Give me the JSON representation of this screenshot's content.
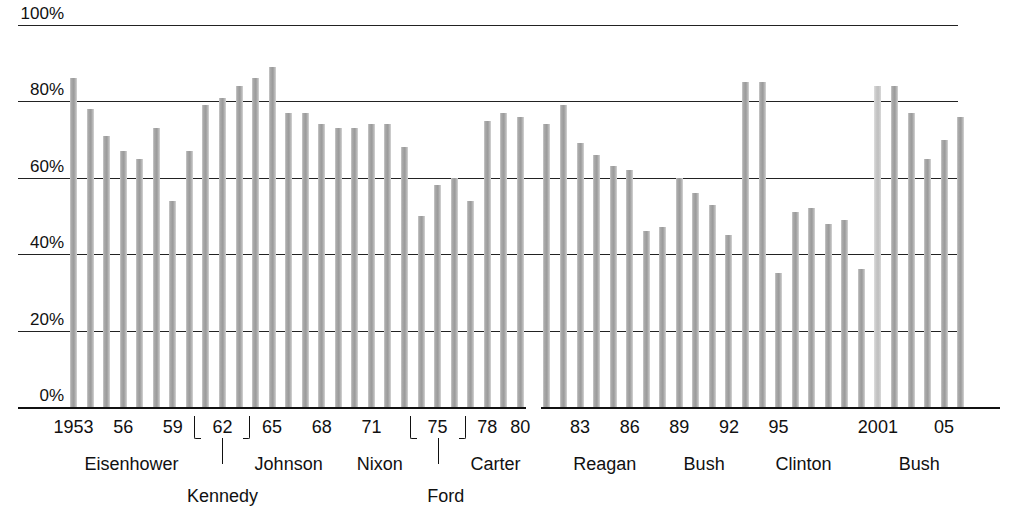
{
  "chart_data": {
    "type": "bar",
    "title": "",
    "xlabel": "",
    "ylabel": "",
    "ylim": [
      0,
      100
    ],
    "grid": true,
    "legend_position": "none",
    "ytick_labels": [
      "100%",
      "80%",
      "60%",
      "40%",
      "20%",
      "0%"
    ],
    "ytick_values": [
      100,
      80,
      60,
      40,
      20,
      0
    ],
    "xtick_labels": [
      "1953",
      "56",
      "59",
      "62",
      "65",
      "68",
      "71",
      "75",
      "78",
      "80",
      "83",
      "86",
      "89",
      "92",
      "95",
      "2001",
      "05"
    ],
    "xtick_years": [
      1953,
      1956,
      1959,
      1962,
      1965,
      1968,
      1971,
      1975,
      1978,
      1980,
      1983,
      1986,
      1989,
      1992,
      1995,
      2001,
      2005
    ],
    "bracket_years": [
      1962,
      1975
    ],
    "categories": [
      1953,
      1954,
      1955,
      1956,
      1957,
      1958,
      1959,
      1960,
      1961,
      1962,
      1963,
      1964,
      1965,
      1966,
      1967,
      1968,
      1969,
      1970,
      1971,
      1972,
      1973,
      1974,
      1975,
      1976,
      1977,
      1978,
      1979,
      1980,
      1981,
      1982,
      1983,
      1984,
      1985,
      1986,
      1987,
      1988,
      1989,
      1990,
      1991,
      1992,
      1993,
      1994,
      1995,
      1996,
      1997,
      1998,
      1999,
      2000,
      2001,
      2002,
      2003,
      2004,
      2005,
      2006
    ],
    "values": [
      86,
      78,
      71,
      67,
      65,
      73,
      54,
      67,
      79,
      81,
      84,
      86,
      89,
      77,
      77,
      74,
      73,
      73,
      74,
      74,
      68,
      50,
      58,
      60,
      54,
      75,
      77,
      76,
      74,
      79,
      69,
      66,
      63,
      62,
      46,
      47,
      60,
      56,
      53,
      45,
      85,
      85,
      35,
      51,
      52,
      48,
      49,
      36,
      84,
      84,
      77,
      65,
      70,
      76
    ],
    "pale_bars": [
      2001
    ],
    "gap_after_year": 1980,
    "presidents": [
      {
        "name": "Eisenhower",
        "start": 1953,
        "end": 1960,
        "style": "inline"
      },
      {
        "name": "Kennedy",
        "start": 1961,
        "end": 1963,
        "style": "callout"
      },
      {
        "name": "Johnson",
        "start": 1964,
        "end": 1968,
        "style": "inline"
      },
      {
        "name": "Nixon",
        "start": 1969,
        "end": 1974,
        "style": "inline"
      },
      {
        "name": "Ford",
        "start": 1975,
        "end": 1976,
        "style": "callout"
      },
      {
        "name": "Carter",
        "start": 1977,
        "end": 1980,
        "style": "inline"
      },
      {
        "name": "Reagan",
        "start": 1981,
        "end": 1988,
        "style": "inline"
      },
      {
        "name": "Bush",
        "start": 1989,
        "end": 1992,
        "style": "inline"
      },
      {
        "name": "Clinton",
        "start": 1993,
        "end": 2000,
        "style": "inline"
      },
      {
        "name": "Bush",
        "start": 2001,
        "end": 2006,
        "style": "inline"
      }
    ],
    "colors": {
      "bar": "#a8a8a8",
      "bar_pale": "#cfcfcf",
      "grid": "#222222",
      "text": "#111111",
      "background": "#ffffff"
    }
  }
}
